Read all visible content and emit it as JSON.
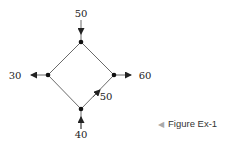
{
  "diagram": {
    "type": "flow-network",
    "nodes": [
      {
        "id": "top",
        "x": 81,
        "y": 42
      },
      {
        "id": "left",
        "x": 48,
        "y": 75
      },
      {
        "id": "right",
        "x": 114,
        "y": 75
      },
      {
        "id": "bottom",
        "x": 81,
        "y": 109
      }
    ],
    "external_flows": [
      {
        "node": "top",
        "direction": "in",
        "value": "50"
      },
      {
        "node": "left",
        "direction": "out",
        "value": "30"
      },
      {
        "node": "right",
        "direction": "out",
        "value": "60"
      },
      {
        "node": "bottom",
        "direction": "in",
        "value": "40"
      }
    ],
    "internal_edges": [
      {
        "from": "top",
        "to": "left"
      },
      {
        "from": "top",
        "to": "right"
      },
      {
        "from": "left",
        "to": "bottom"
      },
      {
        "from": "bottom",
        "to": "right",
        "label": "50"
      }
    ],
    "labels": {
      "top_in": "50",
      "left_out": "30",
      "right_out": "60",
      "bottom_in": "40",
      "bottom_right_edge": "50"
    }
  },
  "caption": {
    "marker": "◀",
    "text": "Figure Ex-1"
  },
  "colors": {
    "line": "#333333",
    "text": "#222222",
    "caption_marker": "#aaaaaa"
  }
}
